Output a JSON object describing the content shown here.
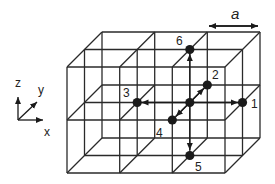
{
  "diagram": {
    "colors": {
      "line": "#2a2a2a",
      "node": "#1a1a1a",
      "background": "#ffffff"
    },
    "grid": {
      "cells_x": 3,
      "cells_y": 2,
      "cells_z": 2
    },
    "lattice_constant_label": "a",
    "axes": {
      "x": "x",
      "y": "y",
      "z": "z"
    },
    "center_node": {
      "label": ""
    },
    "neighbours": [
      {
        "id": "1",
        "label": "1",
        "direction": "+x"
      },
      {
        "id": "2",
        "label": "2",
        "direction": "+y"
      },
      {
        "id": "3",
        "label": "3",
        "direction": "-x"
      },
      {
        "id": "4",
        "label": "4",
        "direction": "-y"
      },
      {
        "id": "5",
        "label": "5",
        "direction": "-z"
      },
      {
        "id": "6",
        "label": "6",
        "direction": "+z"
      }
    ]
  }
}
